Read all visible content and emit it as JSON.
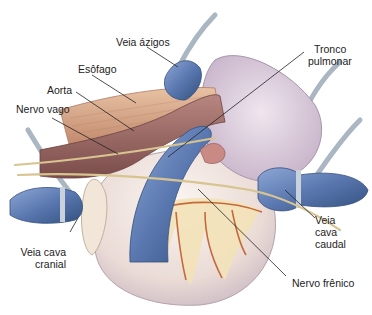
{
  "figure": {
    "labels": {
      "veia_azigos": "Veia ázigos",
      "esofago": "Esôfago",
      "aorta": "Aorta",
      "nervo_vago": "Nervo vago",
      "tronco_pulmonar_1": "Tronco",
      "tronco_pulmonar_2": "pulmonar",
      "veia_cava_cranial_1": "Veia cava",
      "veia_cava_cranial_2": "cranial",
      "veia_cava_caudal_1": "Veia",
      "veia_cava_caudal_2": "cava",
      "veia_cava_caudal_3": "caudal",
      "nervo_frenico": "Nervo frênico"
    },
    "colors": {
      "vein_blue": "#5a78b0",
      "artery_brown": "#9a6a66",
      "esophagus_tan": "#d9a98a",
      "nerve_yellow": "#d8c490",
      "heart_pale": "#eee2dc",
      "pulmonary_lilac": "#d8c8d8",
      "fat_cream": "#f3e2b8",
      "coronary_red": "#c56a3a",
      "tube_gray": "#b8c2cc",
      "leader_line": "#222222"
    }
  }
}
